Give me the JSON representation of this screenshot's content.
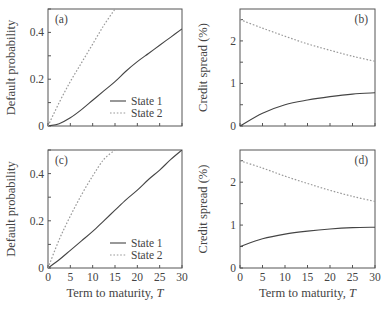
{
  "figure": {
    "xlabel": "Term to maturity, ",
    "xlabel_italic": "T",
    "legend": {
      "state1": "State 1",
      "state2": "State 2"
    },
    "colors": {
      "axis": "#555555",
      "state1": "#444444",
      "state2": "#999999"
    }
  },
  "chart_data": [
    {
      "panel": "(a)",
      "type": "line",
      "ylabel": "Default probability",
      "xlabel": "",
      "xlim": [
        0,
        30
      ],
      "ylim": [
        0,
        0.5
      ],
      "yticks": [
        "0",
        "0.2",
        "0.4"
      ],
      "yticks_values": [
        0,
        0.2,
        0.4
      ],
      "xticks_values": [
        0,
        5,
        10,
        15,
        20,
        25,
        30
      ],
      "xtick_labels_shown": false,
      "legend": [
        "State 1",
        "State 2"
      ],
      "x": [
        0,
        2.5,
        5,
        7.5,
        10,
        12.5,
        15,
        17.5,
        20,
        22.5,
        25,
        27.5,
        30
      ],
      "series": [
        {
          "name": "State 1",
          "style": "solid",
          "values": [
            0,
            0.01,
            0.035,
            0.07,
            0.11,
            0.15,
            0.19,
            0.235,
            0.275,
            0.31,
            0.345,
            0.38,
            0.415
          ]
        },
        {
          "name": "State 2",
          "style": "dotted",
          "values": [
            0,
            0.1,
            0.19,
            0.27,
            0.35,
            0.43,
            0.5,
            null,
            null,
            null,
            null,
            null,
            null
          ]
        }
      ]
    },
    {
      "panel": "(b)",
      "type": "line",
      "ylabel": "Credit spread (%)",
      "xlabel": "",
      "xlim": [
        0,
        30
      ],
      "ylim": [
        0,
        2.75
      ],
      "yticks": [
        "0",
        "1",
        "2"
      ],
      "yticks_values": [
        0,
        1,
        2
      ],
      "xticks_values": [
        0,
        5,
        10,
        15,
        20,
        25,
        30
      ],
      "xtick_labels_shown": false,
      "x": [
        0,
        5,
        10,
        15,
        20,
        25,
        30
      ],
      "series": [
        {
          "name": "State 1",
          "style": "solid",
          "values": [
            0,
            0.3,
            0.5,
            0.61,
            0.69,
            0.75,
            0.78
          ]
        },
        {
          "name": "State 2",
          "style": "dotted",
          "values": [
            2.5,
            2.3,
            2.11,
            1.93,
            1.78,
            1.64,
            1.52
          ]
        }
      ]
    },
    {
      "panel": "(c)",
      "type": "line",
      "ylabel": "Default probability",
      "xlabel": "Term to maturity, T",
      "xlim": [
        0,
        30
      ],
      "ylim": [
        0,
        0.5
      ],
      "yticks": [
        "0",
        "0.2",
        "0.4"
      ],
      "yticks_values": [
        0,
        0.2,
        0.4
      ],
      "xticks": [
        "0",
        "5",
        "10",
        "15",
        "20",
        "25",
        "30"
      ],
      "xticks_values": [
        0,
        5,
        10,
        15,
        20,
        25,
        30
      ],
      "legend": [
        "State 1",
        "State 2"
      ],
      "x": [
        0,
        2.5,
        5,
        7.5,
        10,
        12.5,
        15,
        17.5,
        20,
        22.5,
        25,
        27.5,
        30
      ],
      "series": [
        {
          "name": "State 1",
          "style": "solid",
          "values": [
            0,
            0.035,
            0.075,
            0.115,
            0.155,
            0.2,
            0.245,
            0.29,
            0.33,
            0.375,
            0.415,
            0.46,
            0.5
          ]
        },
        {
          "name": "State 2",
          "style": "dotted",
          "values": [
            0,
            0.12,
            0.22,
            0.31,
            0.39,
            0.46,
            0.5,
            null,
            null,
            null,
            null,
            null,
            null
          ]
        }
      ]
    },
    {
      "panel": "(d)",
      "type": "line",
      "ylabel": "Credit spread (%)",
      "xlabel": "Term to maturity, T",
      "xlim": [
        0,
        30
      ],
      "ylim": [
        0,
        2.75
      ],
      "yticks": [
        "0",
        "1",
        "2"
      ],
      "yticks_values": [
        0,
        1,
        2
      ],
      "xticks": [
        "0",
        "5",
        "10",
        "15",
        "20",
        "25",
        "30"
      ],
      "xticks_values": [
        0,
        5,
        10,
        15,
        20,
        25,
        30
      ],
      "x": [
        0,
        5,
        10,
        15,
        20,
        25,
        30
      ],
      "series": [
        {
          "name": "State 1",
          "style": "solid",
          "values": [
            0.5,
            0.68,
            0.79,
            0.86,
            0.91,
            0.94,
            0.95
          ]
        },
        {
          "name": "State 2",
          "style": "dotted",
          "values": [
            2.5,
            2.33,
            2.14,
            1.97,
            1.81,
            1.67,
            1.55
          ]
        }
      ]
    }
  ]
}
